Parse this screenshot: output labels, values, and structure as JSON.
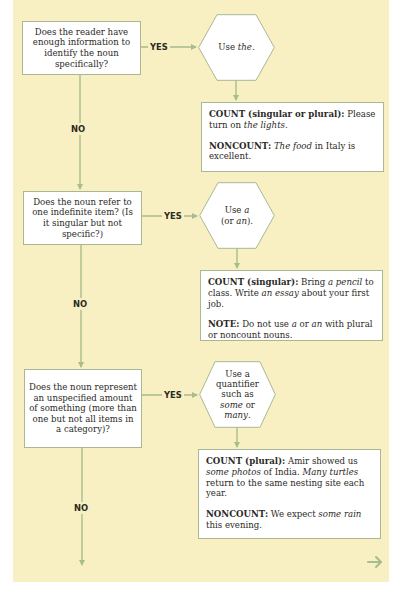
{
  "colors": {
    "panel_bg": "#f8f0c2",
    "connector": "#a7bd8c",
    "box_border": "#a9b893",
    "text": "#2b2a26"
  },
  "labels": {
    "yes": "YES",
    "no": "NO"
  },
  "steps": [
    {
      "question": "Does the reader have enough information to identify the noun specifically?",
      "action": {
        "pre": "Use ",
        "em": "the",
        "post": "."
      },
      "examples": [
        {
          "head": "COUNT (singular or plural):",
          "parts": [
            " Please turn on ",
            {
              "em": "the lights"
            },
            "."
          ]
        },
        {
          "head": "NONCOUNT:",
          "parts": [
            " ",
            {
              "em": "The food"
            },
            " in Italy is excellent."
          ]
        }
      ]
    },
    {
      "question": "Does the noun refer to one indefinite item? (Is it singular but not specific?)",
      "action": {
        "pre": "Use ",
        "em": "a",
        "line2_pre": "(or ",
        "em2": "an",
        "line2_post": ")."
      },
      "examples": [
        {
          "head": "COUNT (singular):",
          "parts": [
            " Bring ",
            {
              "em": "a pencil"
            },
            " to class. Write ",
            {
              "em": "an essay"
            },
            " about your first job."
          ]
        },
        {
          "head": "NOTE:",
          "parts": [
            " Do not use ",
            {
              "em": "a"
            },
            " or ",
            {
              "em": "an"
            },
            " with plural or noncount nouns."
          ]
        }
      ]
    },
    {
      "question": "Does the noun represent an unspecified amount of something (more than one but not all items in a category)?",
      "action": {
        "pre": "Use a quantifier such as ",
        "em": "some",
        "mid": " or ",
        "em2": "many",
        "post": "."
      },
      "examples": [
        {
          "head": "COUNT (plural):",
          "parts": [
            " Amir showed us ",
            {
              "em": "some photos"
            },
            " of India. ",
            {
              "em": "Many turtles"
            },
            " return to the same nesting site each year."
          ]
        },
        {
          "head": "NONCOUNT:",
          "parts": [
            " We expect ",
            {
              "em": "some rain"
            },
            " this evening."
          ]
        }
      ]
    }
  ],
  "next_icon": "arrow-right-icon"
}
